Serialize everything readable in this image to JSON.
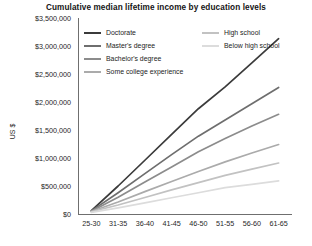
{
  "chart_data": {
    "type": "line",
    "title": "Cumulative median lifetime income by education levels",
    "xlabel": "",
    "ylabel": "US $",
    "categories": [
      "25-30",
      "31-35",
      "36-40",
      "41-45",
      "46-50",
      "51-55",
      "56-60",
      "61-65"
    ],
    "ylim": [
      0,
      3500000
    ],
    "ytick_values": [
      0,
      500000,
      1000000,
      1500000,
      2000000,
      2500000,
      3000000,
      3500000
    ],
    "ytick_labels": [
      "$0",
      "$500,000",
      "$1,000,000",
      "$1,500,000",
      "$2,000,000",
      "$2,500,000",
      "$3,000,000",
      "$3,500,000"
    ],
    "grid": false,
    "legend_position": "top-left-inside",
    "series": [
      {
        "name": "Doctorate",
        "color": "#3b3b3b",
        "values": [
          60000,
          500000,
          960000,
          1420000,
          1880000,
          2270000,
          2700000,
          3130000
        ]
      },
      {
        "name": "Master's degree",
        "color": "#6e6e6e",
        "values": [
          55000,
          380000,
          720000,
          1060000,
          1390000,
          1680000,
          1970000,
          2260000
        ]
      },
      {
        "name": "Bachelor's degree",
        "color": "#8c8c8c",
        "values": [
          50000,
          300000,
          570000,
          840000,
          1110000,
          1350000,
          1570000,
          1780000
        ]
      },
      {
        "name": "Some college experience",
        "color": "#ababab",
        "values": [
          45000,
          215000,
          400000,
          580000,
          760000,
          930000,
          1090000,
          1240000
        ]
      },
      {
        "name": "High school",
        "color": "#c2c2c2",
        "values": [
          40000,
          160000,
          295000,
          430000,
          560000,
          690000,
          800000,
          910000
        ]
      },
      {
        "name": "Below high school",
        "color": "#dcdcdc",
        "values": [
          30000,
          110000,
          200000,
          290000,
          380000,
          470000,
          530000,
          590000
        ]
      }
    ]
  },
  "legend": {
    "columns": [
      [
        "Doctorate",
        "Master's degree",
        "Bachelor's degree",
        "Some college experience"
      ],
      [
        "High school",
        "Below high school"
      ]
    ]
  }
}
